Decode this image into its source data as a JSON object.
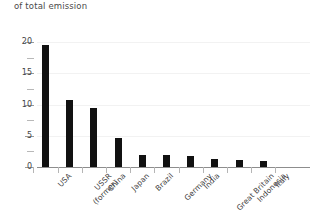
{
  "caption": "of total emission",
  "chart_data": {
    "type": "bar",
    "title": "of total emission",
    "xlabel": "",
    "ylabel": "",
    "ylim": [
      0,
      20
    ],
    "yticks": [
      0,
      5,
      10,
      15,
      20
    ],
    "yticks_minor": [
      2.5,
      7.5,
      12.5,
      17.5
    ],
    "grid": true,
    "legend": "none",
    "bar_color": "#111111",
    "axis_color": "#8d8d8d",
    "categories": [
      "USA",
      "USSR\n(former)",
      "China",
      "Japan",
      "Brazil",
      "Germany",
      "India",
      "Great Britain",
      "Indonesia",
      "Italy"
    ],
    "values": [
      19.6,
      10.8,
      9.5,
      4.6,
      1.9,
      1.9,
      1.8,
      1.3,
      1.2,
      1.0
    ]
  }
}
